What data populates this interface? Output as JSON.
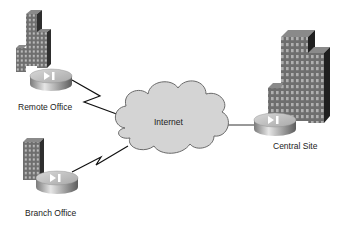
{
  "diagram": {
    "type": "network-topology",
    "nodes": [
      {
        "id": "remote-office",
        "label": "Remote Office",
        "kind": "small-office-with-router"
      },
      {
        "id": "branch-office",
        "label": "Branch Office",
        "kind": "small-office-with-router"
      },
      {
        "id": "internet",
        "label": "Internet",
        "kind": "cloud"
      },
      {
        "id": "central-site",
        "label": "Central Site",
        "kind": "headquarters-with-router"
      }
    ],
    "edges": [
      {
        "from": "remote-office",
        "to": "internet",
        "style": "serial-lightning"
      },
      {
        "from": "branch-office",
        "to": "internet",
        "style": "serial-lightning"
      },
      {
        "from": "internet",
        "to": "central-site",
        "style": "straight-line"
      }
    ],
    "colors": {
      "cloud_fill": "#d4d4d4",
      "cloud_stroke": "#6a6a6a",
      "building_front": "#6e6e6e",
      "building_side": "#2e2e2e",
      "building_top": "#8a8a8a",
      "window": "#b8b8b8",
      "router_top": "#c8c8c8",
      "router_side": "#9a9a9a",
      "line": "#111111"
    }
  }
}
